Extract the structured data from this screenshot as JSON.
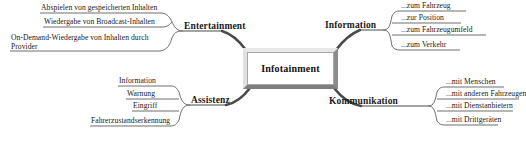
{
  "diagram": {
    "title": "Infotainment",
    "center": {
      "label": "Infotainment"
    },
    "colors": {
      "text": "#1a1a1a",
      "line": "#4a4a4a",
      "node_face": "#ffffff",
      "node_bevel_light": "#e8e8e8",
      "node_bevel_dark": "#7e7e7e",
      "background": "#ffffff"
    },
    "branches": [
      {
        "id": "entertainment",
        "label": "Entertainment",
        "position": "upper-left",
        "children": [
          {
            "label": "Abspielen von gespeicherten Inhalten"
          },
          {
            "label": "Wiedergabe von Broadcast-Inhalten"
          },
          {
            "label": "On-Demand-Wiedergabe von Inhalten durch Provider"
          }
        ]
      },
      {
        "id": "information",
        "label": "Information",
        "position": "upper-right",
        "children": [
          {
            "label": "...zum Fahrzeug"
          },
          {
            "label": "...zur Position"
          },
          {
            "label": "...zum Fahrzeugumfeld"
          },
          {
            "label": "...zum Verkehr"
          }
        ]
      },
      {
        "id": "assistenz",
        "label": "Assistenz",
        "position": "lower-left",
        "children": [
          {
            "label": "Information"
          },
          {
            "label": "Warnung"
          },
          {
            "label": "Eingriff"
          },
          {
            "label": "Fahrerzustandserkennung"
          }
        ]
      },
      {
        "id": "kommunikation",
        "label": "Kommunikation",
        "position": "lower-right",
        "children": [
          {
            "label": "...mit Menschen"
          },
          {
            "label": "...mit anderen Fahrzeugen"
          },
          {
            "label": "...mit Dienstanbietern"
          },
          {
            "label": "...mit Drittgeräten"
          }
        ]
      }
    ]
  }
}
